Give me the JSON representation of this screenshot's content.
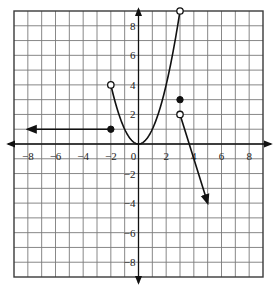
{
  "chart_data": {
    "type": "line",
    "title": "",
    "xlabel": "",
    "ylabel": "",
    "xlim": [
      -9,
      9
    ],
    "ylim": [
      -9,
      9
    ],
    "grid": true,
    "x_ticks": [
      -8,
      -6,
      -4,
      -2,
      0,
      2,
      4,
      6,
      8
    ],
    "y_ticks": [
      -8,
      -6,
      -4,
      -2,
      2,
      4,
      6,
      8
    ],
    "x_tick_labels": [
      "−8",
      "−6",
      "−4",
      "−2",
      "0",
      "2",
      "4",
      "6",
      "8"
    ],
    "y_tick_labels": [
      "−8",
      "−6",
      "−4",
      "−2",
      "2",
      "4",
      "6",
      "8"
    ],
    "series": [
      {
        "name": "ray-left",
        "kind": "ray",
        "description": "Horizontal ray y = 1 for x ≤ -2, extending left (arrow)",
        "points": [
          [
            -2,
            1
          ],
          [
            -8,
            1
          ]
        ],
        "endpoint": {
          "x": -2,
          "y": 1,
          "style": "closed"
        }
      },
      {
        "name": "parabola",
        "kind": "curve",
        "description": "y = x^2 for -2 < x < 3",
        "function": "x^2",
        "domain": [
          -2,
          3
        ],
        "open_endpoints": [
          {
            "x": -2,
            "y": 4
          },
          {
            "x": 3,
            "y": 9
          }
        ]
      },
      {
        "name": "isolated-point",
        "kind": "point",
        "points": [
          [
            3,
            3
          ]
        ],
        "style": "closed"
      },
      {
        "name": "ray-right",
        "kind": "ray",
        "description": "Line from (3,2) decreasing with slope -3, extending down-right (arrow)",
        "points": [
          [
            3,
            2
          ],
          [
            5,
            -4
          ]
        ],
        "endpoint": {
          "x": 3,
          "y": 2,
          "style": "open"
        }
      }
    ]
  }
}
